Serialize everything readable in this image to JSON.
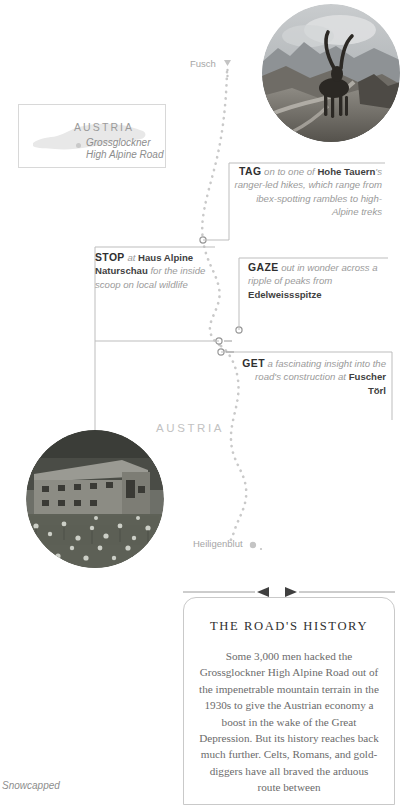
{
  "inset": {
    "country": "AUSTRIA",
    "road_label_line1": "Grossglockner",
    "road_label_line2": "High Alpine Road"
  },
  "map": {
    "country_label": "AUSTRIA",
    "places": [
      {
        "name": "Fusch",
        "marker": "pin-icon"
      },
      {
        "name": "Heiligenblut",
        "marker": "dot-icon"
      }
    ]
  },
  "tips": [
    {
      "id": "tag",
      "verb": "TAG",
      "text_html": "on to one of <b>Hohe Tauern</b>'s ranger-led hikes, which range from ibex-spotting rambles to high-Alpine treks",
      "plain": "TAG on to one of Hohe Tauern's ranger-led hikes, which range from ibex-spotting rambles to high-Alpine treks"
    },
    {
      "id": "stop",
      "verb": "STOP",
      "text_html": "at <b>Haus Alpine Naturschau</b> for the inside scoop on local wildlife",
      "plain": "STOP at Haus Alpine Naturschau for the inside scoop on local wildlife"
    },
    {
      "id": "gaze",
      "verb": "GAZE",
      "text_html": "out in wonder across a ripple of peaks from <b>Edelweissspitze</b>",
      "plain": "GAZE out in wonder across a ripple of peaks from Edelweissspitze"
    },
    {
      "id": "get",
      "verb": "GET",
      "text_html": "a fascinating insight into the road's construction at <b>Fuscher Törl</b>",
      "plain": "GET a fascinating insight into the road's construction at Fuscher Törl"
    }
  ],
  "history": {
    "title": "THE ROAD'S HISTORY",
    "body": "Some 3,000 men hacked the Grossglockner High Alpine Road out of the impenetrable mountain terrain in the 1930s to give the Austrian economy a boost in the wake of the Great Depression. But its history reaches back much further. Celts, Romans, and gold-diggers have all braved the arduous route between"
  },
  "caption": "Snowcapped",
  "photos": [
    {
      "id": "ibex",
      "alt": "ibex-on-mountain-ridge-photo"
    },
    {
      "id": "haus",
      "alt": "alpine-stone-building-wildflowers-photo"
    }
  ],
  "colors": {
    "route": "#c4c4c4",
    "connector": "#b4b4b4",
    "ink": "#3f3f3f",
    "muted": "#9a9a9a",
    "border": "#c9c9c9"
  }
}
